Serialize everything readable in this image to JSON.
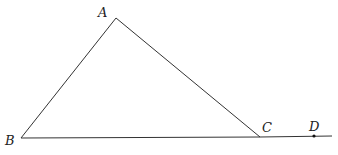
{
  "diagram": {
    "type": "geometry",
    "stroke_color": "#333333",
    "background": "#ffffff",
    "points": {
      "A": {
        "label": "A",
        "x": 116,
        "y": 18
      },
      "B": {
        "label": "B",
        "x": 21,
        "y": 138
      },
      "C": {
        "label": "C",
        "x": 260,
        "y": 137
      },
      "D": {
        "label": "D",
        "x": 314,
        "y": 136
      }
    },
    "segments": [
      {
        "from": "A",
        "to": "B"
      },
      {
        "from": "A",
        "to": "C"
      },
      {
        "from": "B",
        "to": "C"
      },
      {
        "from": "C",
        "to": "extension_end"
      }
    ],
    "extension_end": {
      "x": 332,
      "y": 136
    },
    "marked_points": [
      "D"
    ]
  },
  "labels": {
    "A": "A",
    "B": "B",
    "C": "C",
    "D": "D"
  }
}
